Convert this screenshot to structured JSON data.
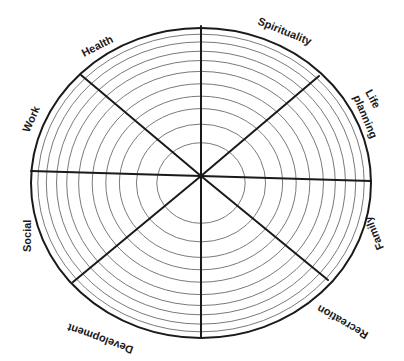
{
  "diagram": {
    "center": {
      "x": 201,
      "y": 176
    },
    "radius": {
      "rx": 170,
      "ry": 150
    },
    "ring_fractions": [
      0.26,
      0.38,
      0.48,
      0.56,
      0.64,
      0.72,
      0.79,
      0.85,
      0.91,
      0.96
    ],
    "colors": {
      "outer": "#1a1a1a",
      "ring": "#7a7a7a",
      "spoke": "#1a1a1a",
      "background": "#ffffff"
    },
    "spokes": [
      {
        "x2": 201,
        "y2": 26
      },
      {
        "x2": 319,
        "y2": 76
      },
      {
        "x2": 371,
        "y2": 181
      },
      {
        "x2": 328,
        "y2": 280
      },
      {
        "x2": 201,
        "y2": 338
      },
      {
        "x2": 73,
        "y2": 282
      },
      {
        "x2": 31,
        "y2": 171
      },
      {
        "x2": 81,
        "y2": 75
      }
    ],
    "segments": [
      {
        "label": "Health"
      },
      {
        "label": "Spirituality"
      },
      {
        "label": "Life"
      },
      {
        "label": "planning"
      },
      {
        "label": "Family"
      },
      {
        "label": "Recreation"
      },
      {
        "label": "Development"
      },
      {
        "label": "Social"
      },
      {
        "label": "Work"
      }
    ]
  }
}
